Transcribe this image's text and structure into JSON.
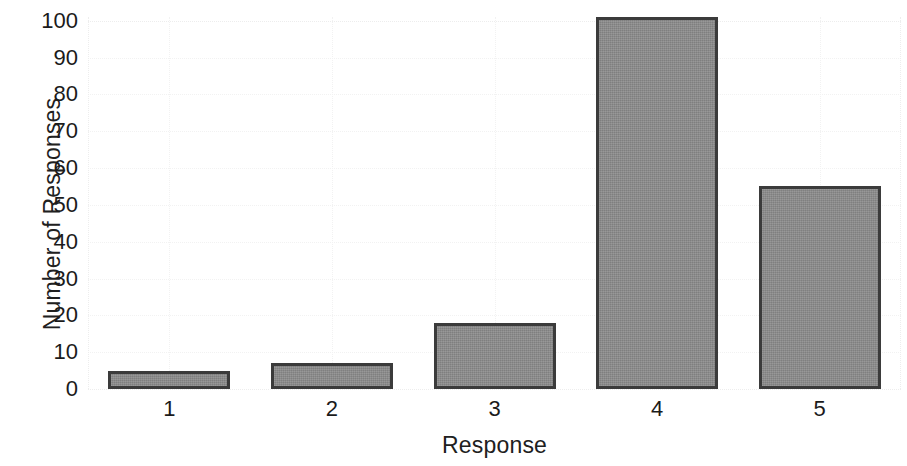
{
  "chart_data": {
    "type": "bar",
    "title": "",
    "subtitle": "",
    "xlabel": "Response",
    "ylabel": "Number of Responses",
    "categories": [
      "1",
      "2",
      "3",
      "4",
      "5"
    ],
    "values": [
      5,
      7,
      18,
      101,
      55
    ],
    "series": [
      {
        "name": "Number of Responses",
        "values": [
          5,
          7,
          18,
          101,
          55
        ]
      }
    ],
    "ylim": [
      0,
      101
    ],
    "xlim": [
      0.5,
      5.5
    ],
    "ytick_labels": [
      "0",
      "10",
      "20",
      "30",
      "40",
      "50",
      "60",
      "70",
      "80",
      "90",
      "100"
    ],
    "ytick_values": [
      0,
      10,
      20,
      30,
      40,
      50,
      60,
      70,
      80,
      90,
      100
    ],
    "xtick_labels": [
      "1",
      "2",
      "3",
      "4",
      "5"
    ],
    "grid": true,
    "grid_axis": "both",
    "grid_style": "dotted",
    "legend": false,
    "legend_position": "none",
    "annotations": [],
    "colors": {
      "bar_fill": "#8c8c8c",
      "bar_edge": "#3b3b3b",
      "grid": "#f2f2f2",
      "text": "#1b1b1b",
      "background": "#ffffff"
    }
  }
}
